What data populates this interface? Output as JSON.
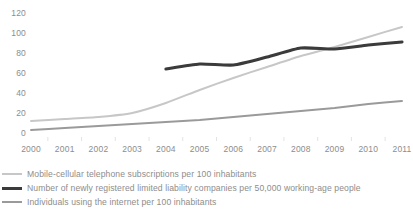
{
  "chart_data": {
    "type": "line",
    "title": "",
    "xlabel": "",
    "ylabel": "",
    "grid": false,
    "legend_position": "bottom-left",
    "categories": [
      "2000",
      "2001",
      "2002",
      "2003",
      "2004",
      "2005",
      "2006",
      "2007",
      "2008",
      "2009",
      "2010",
      "2011"
    ],
    "x": [
      2000,
      2001,
      2002,
      2003,
      2004,
      2005,
      2006,
      2007,
      2008,
      2009,
      2010,
      2011
    ],
    "xlim": [
      2000,
      2011
    ],
    "ylim": [
      0,
      120
    ],
    "yticks": [
      0,
      20,
      40,
      60,
      80,
      100,
      120
    ],
    "series": [
      {
        "name": "Mobile-cellular telephone subscriptions per 100 inhabitants",
        "color": "#c7c7c7",
        "width": 1.9,
        "values": [
          13,
          15,
          17,
          21,
          31,
          44,
          56,
          67,
          78,
          87,
          97,
          107
        ]
      },
      {
        "name": "Number of newly registered limited liability companies per 50,000 working-age people",
        "color": "#3b3b3b",
        "width": 3.1,
        "values": [
          null,
          null,
          null,
          null,
          65,
          70,
          69,
          77,
          86,
          85,
          89,
          92
        ]
      },
      {
        "name": "Individuals using the internet per 100 inhabitants",
        "color": "#9a9a9a",
        "width": 1.9,
        "values": [
          4,
          6,
          8,
          10,
          12,
          14,
          17,
          20,
          23,
          26,
          30,
          33
        ]
      }
    ]
  },
  "axes": {
    "y_tick_labels": [
      "120",
      "100",
      "80",
      "60",
      "40",
      "20",
      "0"
    ],
    "x_tick_labels": [
      "2000",
      "2001",
      "2002",
      "2003",
      "2004",
      "2005",
      "2006",
      "2007",
      "2008",
      "2009",
      "2010",
      "2011"
    ]
  },
  "legend": {
    "items": [
      {
        "label": "Mobile-cellular telephone subscriptions per 100 inhabitants",
        "color": "#c7c7c7",
        "weight": "thin"
      },
      {
        "label": "Number of newly registered limited liability companies per 50,000 working-age people",
        "color": "#3b3b3b",
        "weight": "thick"
      },
      {
        "label": "Individuals using the internet per 100 inhabitants",
        "color": "#9a9a9a",
        "weight": "thin"
      }
    ]
  },
  "colors": {
    "background": "#ffffff",
    "text": "#8d8d8d",
    "series_mobile": "#c7c7c7",
    "series_companies": "#3b3b3b",
    "series_internet": "#9a9a9a"
  }
}
